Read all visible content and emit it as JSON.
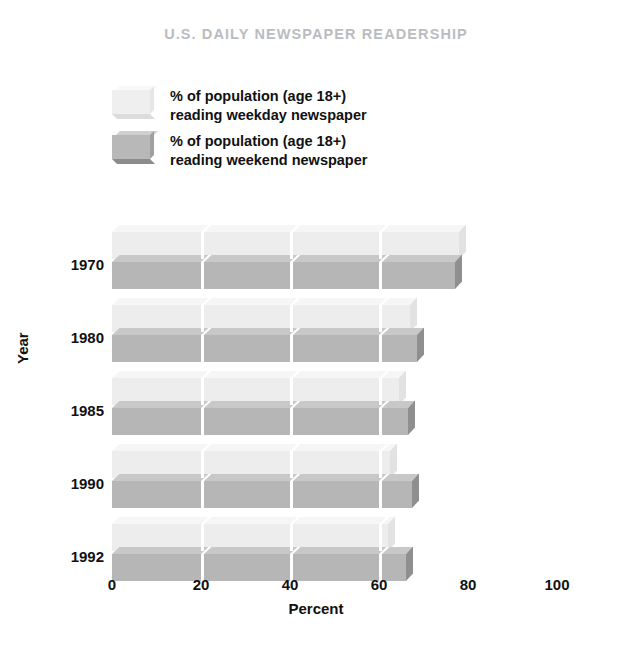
{
  "chart_data": {
    "type": "bar",
    "orientation": "horizontal",
    "title": "U.S. DAILY NEWSPAPER READERSHIP",
    "xlabel": "Percent",
    "ylabel": "Year",
    "xlim": [
      0,
      100
    ],
    "xticks": [
      0,
      20,
      40,
      60,
      80,
      100
    ],
    "xtick_labels": [
      "0",
      "20",
      "40",
      "60",
      "80",
      "100"
    ],
    "categories": [
      "1970",
      "1980",
      "1985",
      "1990",
      "1992"
    ],
    "grid": true,
    "legend_position": "top-left",
    "series": [
      {
        "name": "% of population (age 18+) reading weekday newspaper",
        "short_name": "weekday",
        "color": "#ededed",
        "values": [
          78,
          67,
          64.5,
          62.5,
          62
        ]
      },
      {
        "name": "% of population (age 18+) reading weekend newspaper",
        "short_name": "weekend",
        "color": "#b6b6b6",
        "values": [
          77,
          68.5,
          66.5,
          67.5,
          66
        ]
      }
    ]
  },
  "title": {
    "text": "U.S. DAILY NEWSPAPER READERSHIP",
    "color": "#b9bdc1"
  },
  "legend": {
    "items": [
      {
        "line1": "% of population (age 18+)",
        "line2": "reading weekday newspaper",
        "swatch": "legend-swatch-weekday"
      },
      {
        "line1": "% of population (age 18+)",
        "line2": "reading weekend newspaper",
        "swatch": "legend-swatch-weekend"
      }
    ]
  },
  "axes": {
    "y_title": "Year",
    "x_title": "Percent",
    "y_labels": [
      "1970",
      "1980",
      "1985",
      "1990",
      "1992"
    ],
    "x_labels": [
      "0",
      "20",
      "40",
      "60",
      "80",
      "100"
    ]
  },
  "colors": {
    "weekday_front": "#ededed",
    "weekday_top": "#f6f6f6",
    "weekday_side": "#e2e2e2",
    "weekend_front": "#b6b6b6",
    "weekend_top": "#c8c8c8",
    "weekend_side": "#8f8f8f",
    "text": "#111111",
    "title": "#b9bdc1",
    "background": "#ffffff"
  }
}
